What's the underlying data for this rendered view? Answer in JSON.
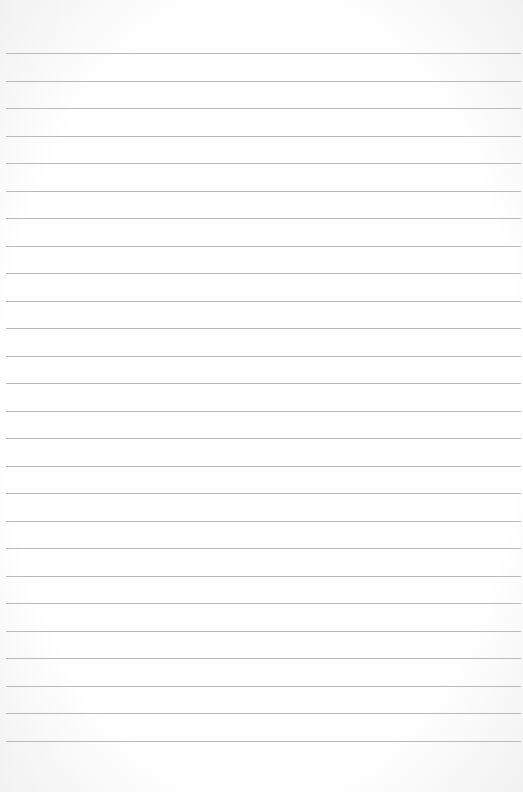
{
  "paper": {
    "type": "lined-notepad",
    "background_color": "#ffffff",
    "line_color": "#b9b9b9",
    "first_line_y": 53,
    "line_spacing": 27.5,
    "line_count": 26,
    "text": ""
  }
}
